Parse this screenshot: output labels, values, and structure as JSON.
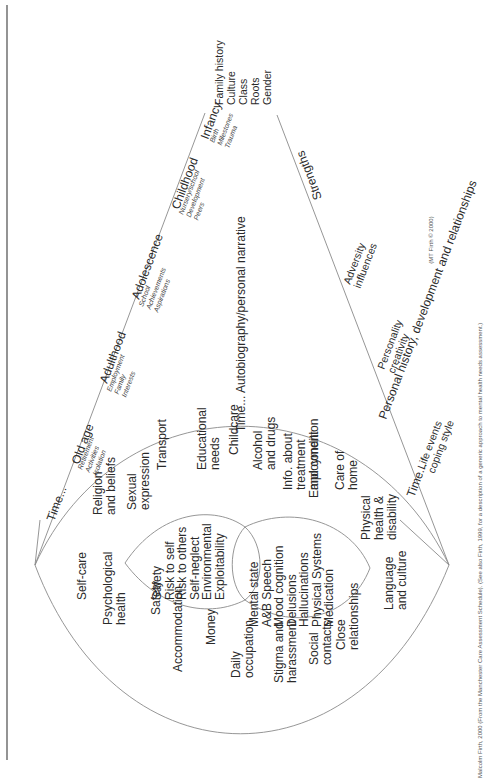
{
  "figure": {
    "background": "#ffffff",
    "line_color": "#8a8a8a",
    "text_color": "#2a2a2a",
    "context_list": [
      "Family history",
      "Culture",
      "Class",
      "Roots",
      "Gender"
    ],
    "time_axis_top": {
      "prefix": "Time...",
      "stages": [
        {
          "name": "Old age",
          "items": [
            "Retirement",
            "Activities",
            "Isolation"
          ]
        },
        {
          "name": "Adulthood",
          "items": [
            "Employment",
            "Family",
            "Interests"
          ]
        },
        {
          "name": "Adolescence",
          "items": [
            "School",
            "Achievements",
            "Aspirations"
          ]
        },
        {
          "name": "Childhood",
          "items": [
            "Nursery/school",
            "Development",
            "Peers"
          ]
        },
        {
          "name": "Infancy",
          "items": [
            "Birth",
            "Milestones",
            "Trauma"
          ]
        }
      ]
    },
    "narrative": "Time... Autobiography/personal narrative",
    "time_axis_bottom": {
      "title": "Personal history, development and relationships",
      "strengths": "Strengths",
      "prefix": "Time...",
      "groups": [
        [
          "Life events",
          "coping style"
        ],
        [
          "Personality",
          "creativity"
        ],
        [
          "Adversity",
          "influences"
        ]
      ]
    },
    "outer_needs": [
      "Self-care",
      [
        "Psychological",
        "health"
      ],
      "Safety",
      "Accommodation",
      "Money",
      [
        "Daily",
        "occupation"
      ],
      [
        "Stigma and",
        "harassment"
      ],
      [
        "Social",
        "contacts"
      ],
      [
        "Close",
        "relationships"
      ],
      [
        "Language",
        "and culture"
      ],
      [
        "Physical",
        "health &",
        "disability"
      ],
      [
        "Care of",
        "home"
      ],
      "Employment",
      [
        "Info. about",
        "treatment",
        "and condition"
      ],
      [
        "Alcohol",
        "and drugs"
      ],
      "Childcare",
      [
        "Educational",
        "needs"
      ],
      "Transport",
      [
        "Sexual",
        "expression"
      ],
      [
        "Religion",
        "and beliefs"
      ]
    ],
    "risk_circle": [
      "Safety",
      "Risk to self",
      "Risk to others",
      "Self-neglect",
      "Environmental",
      "Exploitability"
    ],
    "mental_state_circle": [
      "Mental state",
      "A&B Speech",
      "Mood cognition",
      "Delusions",
      "Hallucinations",
      "Physical Systems",
      "Medication"
    ],
    "copyright": "(MT Firth © 2000)",
    "caption": "Malcolm Firth, 2000 (From the Manchester Care Assessment Schedule). (See also Firth, 1999, for a description of a generic approach to mental health needs assessment.)"
  }
}
